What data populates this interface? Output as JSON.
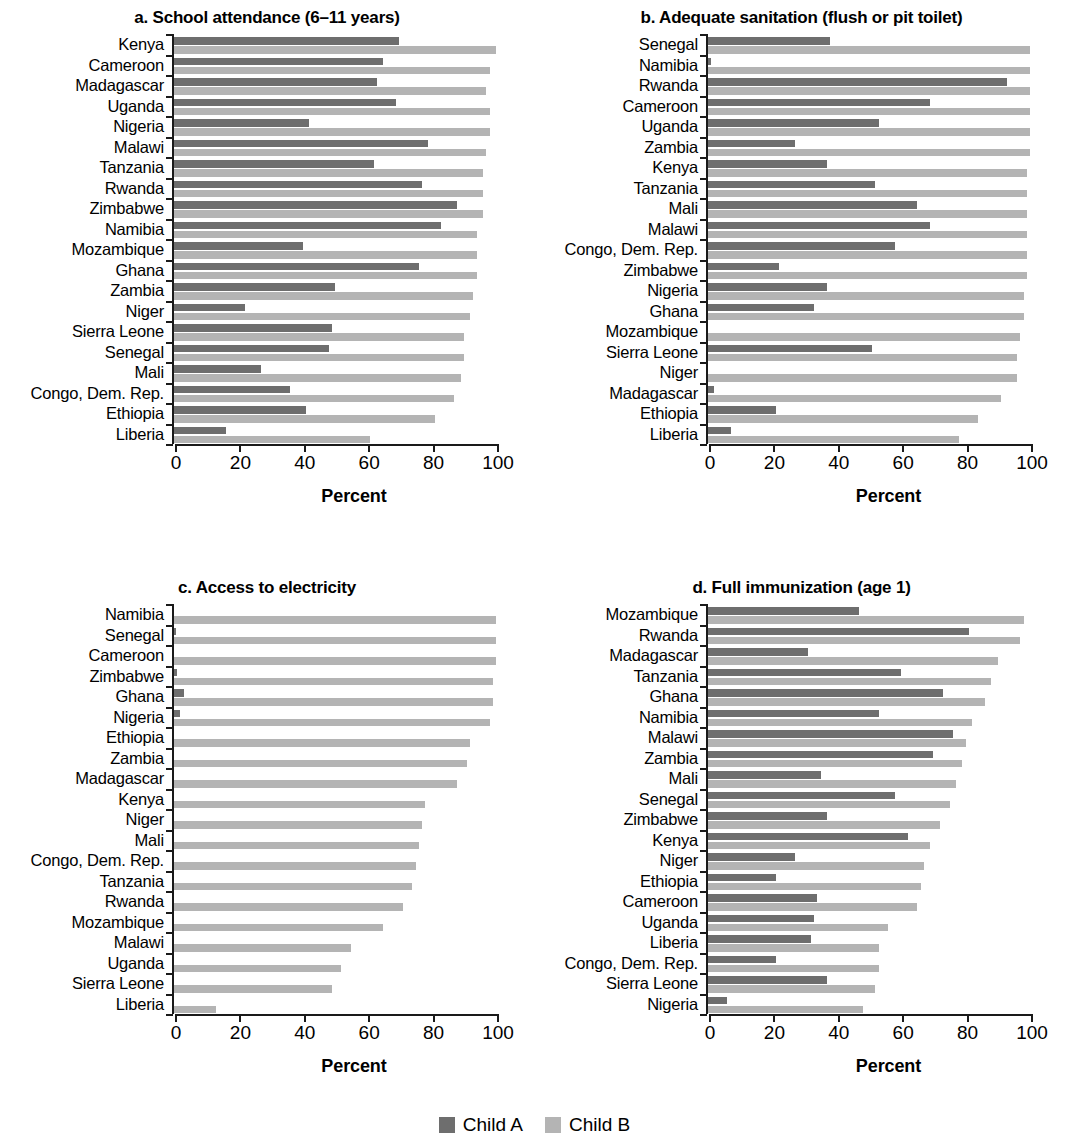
{
  "figure": {
    "legend": {
      "series": [
        {
          "name": "Child A",
          "color": "#6e6e6e"
        },
        {
          "name": "Child B",
          "color": "#b4b4b4"
        }
      ]
    },
    "axis_title": "Percent",
    "xticks": [
      "0",
      "20",
      "40",
      "60",
      "80",
      "100"
    ]
  },
  "chart_data": [
    {
      "type": "bar",
      "orientation": "horizontal",
      "panel": "a",
      "title": "a. School attendance (6–11 years)",
      "xlabel": "Percent",
      "ylabel": "",
      "xlim": [
        0,
        100
      ],
      "grid": false,
      "legend_position": "bottom-center (shared)",
      "categories": [
        "Kenya",
        "Cameroon",
        "Madagascar",
        "Uganda",
        "Nigeria",
        "Malawi",
        "Tanzania",
        "Rwanda",
        "Zimbabwe",
        "Namibia",
        "Mozambique",
        "Ghana",
        "Zambia",
        "Niger",
        "Sierra Leone",
        "Senegal",
        "Mali",
        "Congo, Dem. Rep.",
        "Ethiopia",
        "Liberia"
      ],
      "series": [
        {
          "name": "Child A",
          "color": "#6e6e6e",
          "values": [
            70,
            65,
            63,
            69,
            42,
            79,
            62,
            77,
            88,
            83,
            40,
            76,
            50,
            22,
            49,
            48,
            27,
            36,
            41,
            16
          ]
        },
        {
          "name": "Child B",
          "color": "#b4b4b4",
          "values": [
            100,
            98,
            97,
            98,
            98,
            97,
            96,
            96,
            96,
            94,
            94,
            94,
            93,
            92,
            90,
            90,
            89,
            87,
            81,
            61
          ]
        }
      ]
    },
    {
      "type": "bar",
      "orientation": "horizontal",
      "panel": "b",
      "title": "b. Adequate sanitation (flush or pit toilet)",
      "xlabel": "Percent",
      "ylabel": "",
      "xlim": [
        0,
        100
      ],
      "grid": false,
      "legend_position": "bottom-center (shared)",
      "categories": [
        "Senegal",
        "Namibia",
        "Rwanda",
        "Cameroon",
        "Uganda",
        "Zambia",
        "Kenya",
        "Tanzania",
        "Mali",
        "Malawi",
        "Congo, Dem. Rep.",
        "Zimbabwe",
        "Nigeria",
        "Ghana",
        "Mozambique",
        "Sierra Leone",
        "Niger",
        "Madagascar",
        "Ethiopia",
        "Liberia"
      ],
      "series": [
        {
          "name": "Child A",
          "color": "#6e6e6e",
          "values": [
            38,
            1,
            93,
            69,
            53,
            27,
            37,
            52,
            65,
            69,
            58,
            22,
            37,
            33,
            0,
            51,
            0,
            2,
            21,
            7
          ]
        },
        {
          "name": "Child B",
          "color": "#b4b4b4",
          "values": [
            100,
            100,
            100,
            100,
            100,
            100,
            99,
            99,
            99,
            99,
            99,
            99,
            98,
            98,
            97,
            96,
            96,
            91,
            84,
            78
          ]
        }
      ]
    },
    {
      "type": "bar",
      "orientation": "horizontal",
      "panel": "c",
      "title": "c. Access to electricity",
      "xlabel": "Percent",
      "ylabel": "",
      "xlim": [
        0,
        100
      ],
      "grid": false,
      "legend_position": "bottom-center (shared)",
      "categories": [
        "Namibia",
        "Senegal",
        "Cameroon",
        "Zimbabwe",
        "Ghana",
        "Nigeria",
        "Ethiopia",
        "Zambia",
        "Madagascar",
        "Kenya",
        "Niger",
        "Mali",
        "Congo, Dem. Rep.",
        "Tanzania",
        "Rwanda",
        "Mozambique",
        "Malawi",
        "Uganda",
        "Sierra Leone",
        "Liberia"
      ],
      "series": [
        {
          "name": "Child A",
          "color": "#6e6e6e",
          "values": [
            0,
            0.5,
            0,
            1,
            3,
            2,
            0,
            0,
            0,
            0,
            0,
            0,
            0,
            0,
            0,
            0,
            0,
            0,
            0,
            0
          ]
        },
        {
          "name": "Child B",
          "color": "#b4b4b4",
          "values": [
            100,
            100,
            100,
            99,
            99,
            98,
            92,
            91,
            88,
            78,
            77,
            76,
            75,
            74,
            71,
            65,
            55,
            52,
            49,
            13
          ]
        }
      ]
    },
    {
      "type": "bar",
      "orientation": "horizontal",
      "panel": "d",
      "title": "d. Full immunization (age 1)",
      "xlabel": "Percent",
      "ylabel": "",
      "xlim": [
        0,
        100
      ],
      "grid": false,
      "legend_position": "bottom-center (shared)",
      "categories": [
        "Mozambique",
        "Rwanda",
        "Madagascar",
        "Tanzania",
        "Ghana",
        "Namibia",
        "Malawi",
        "Zambia",
        "Mali",
        "Senegal",
        "Zimbabwe",
        "Kenya",
        "Niger",
        "Ethiopia",
        "Cameroon",
        "Uganda",
        "Liberia",
        "Congo, Dem. Rep.",
        "Sierra Leone",
        "Nigeria"
      ],
      "series": [
        {
          "name": "Child A",
          "color": "#6e6e6e",
          "values": [
            47,
            81,
            31,
            60,
            73,
            53,
            76,
            70,
            35,
            58,
            37,
            62,
            27,
            21,
            34,
            33,
            32,
            21,
            37,
            6
          ]
        },
        {
          "name": "Child B",
          "color": "#b4b4b4",
          "values": [
            98,
            97,
            90,
            88,
            86,
            82,
            80,
            79,
            77,
            75,
            72,
            69,
            67,
            66,
            65,
            56,
            53,
            53,
            52,
            48
          ]
        }
      ]
    }
  ]
}
